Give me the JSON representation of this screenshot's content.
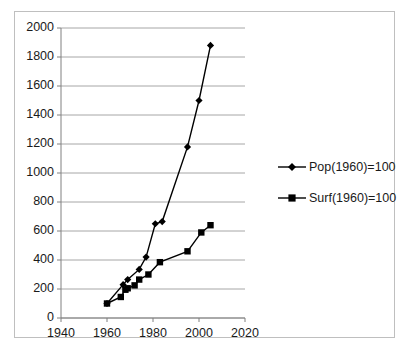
{
  "chart_data": {
    "type": "line",
    "title": "",
    "xlabel": "",
    "ylabel": "",
    "xlim": [
      1940,
      2020
    ],
    "ylim": [
      0,
      2000
    ],
    "xticks": [
      1940,
      1960,
      1980,
      2000,
      2020
    ],
    "yticks": [
      0,
      200,
      400,
      600,
      800,
      1000,
      1200,
      1400,
      1600,
      1800,
      2000
    ],
    "grid": "horizontal",
    "legend_position": "right",
    "series": [
      {
        "name": "Pop(1960)=100",
        "marker": "diamond",
        "color": "#000000",
        "points": [
          [
            1960,
            100
          ],
          [
            1967,
            230
          ],
          [
            1969,
            265
          ],
          [
            1974,
            335
          ],
          [
            1977,
            420
          ],
          [
            1981,
            650
          ],
          [
            1984,
            665
          ],
          [
            1995,
            1180
          ],
          [
            2000,
            1500
          ],
          [
            2005,
            1880
          ]
        ]
      },
      {
        "name": "Surf(1960)=100",
        "marker": "square",
        "color": "#000000",
        "points": [
          [
            1960,
            100
          ],
          [
            1966,
            145
          ],
          [
            1968,
            195
          ],
          [
            1969,
            205
          ],
          [
            1972,
            225
          ],
          [
            1974,
            265
          ],
          [
            1978,
            300
          ],
          [
            1983,
            385
          ],
          [
            1995,
            460
          ],
          [
            2001,
            590
          ],
          [
            2005,
            640
          ]
        ]
      }
    ]
  },
  "axis": {
    "y_tick_labels": [
      "0",
      "200",
      "400",
      "600",
      "800",
      "1000",
      "1200",
      "1400",
      "1600",
      "1800",
      "2000"
    ],
    "x_tick_labels": [
      "1940",
      "1960",
      "1980",
      "2000",
      "2020"
    ]
  },
  "legend": {
    "items": [
      {
        "label": "Pop(1960)=100",
        "marker": "diamond"
      },
      {
        "label": "Surf(1960)=100",
        "marker": "square"
      }
    ]
  },
  "style": {
    "axis_color": "#808080",
    "grid_color": "#a6a6a6",
    "series_color": "#000000",
    "frame_color": "#bfbfbf",
    "text_color": "#1a1a1a"
  }
}
